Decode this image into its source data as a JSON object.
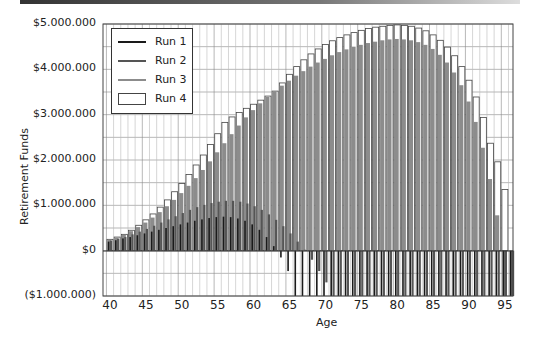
{
  "chart_data": {
    "type": "bar",
    "title": "",
    "xlabel": "Age",
    "ylabel": "Retirement Funds",
    "ylim": [
      -1000000,
      5000000
    ],
    "xlim": [
      40,
      96
    ],
    "grid": true,
    "legend_position": "upper-left",
    "y_ticks": [
      "$5.000.000",
      "$4.000.000",
      "$3.000.000",
      "$2.000.000",
      "$1.000.000",
      "$0",
      "($1.000.000)"
    ],
    "x_ticks": [
      "40",
      "45",
      "50",
      "55",
      "60",
      "65",
      "70",
      "75",
      "80",
      "85",
      "90",
      "95"
    ],
    "x": [
      40,
      41,
      42,
      43,
      44,
      45,
      46,
      47,
      48,
      49,
      50,
      51,
      52,
      53,
      54,
      55,
      56,
      57,
      58,
      59,
      60,
      61,
      62,
      63,
      64,
      65,
      66,
      67,
      68,
      69,
      70,
      71,
      72,
      73,
      74,
      75,
      76,
      77,
      78,
      79,
      80,
      81,
      82,
      83,
      84,
      85,
      86,
      87,
      88,
      89,
      90,
      91,
      92,
      93,
      94,
      95,
      96
    ],
    "series": [
      {
        "name": "Run 1",
        "color": "#1a1a1a",
        "values": [
          200000,
          230000,
          270000,
          300000,
          340000,
          380000,
          420000,
          460000,
          500000,
          540000,
          580000,
          620000,
          660000,
          690000,
          720000,
          740000,
          750000,
          740000,
          710000,
          660000,
          580000,
          460000,
          300000,
          100000,
          -150000,
          -450000,
          -1000000,
          -1000000,
          -1000000,
          -1000000,
          -1000000,
          -1000000,
          -1000000,
          -1000000,
          -1000000,
          -1000000,
          -1000000,
          -1000000,
          -1000000,
          -1000000,
          -1000000,
          -1000000,
          -1000000,
          -1000000,
          -1000000,
          -1000000,
          -1000000,
          -1000000,
          -1000000,
          -1000000,
          -1000000,
          -1000000,
          -1000000,
          -1000000,
          -1000000,
          -1000000,
          -1000000
        ]
      },
      {
        "name": "Run 2",
        "color": "#555555",
        "values": [
          220000,
          260000,
          300000,
          360000,
          420000,
          480000,
          550000,
          620000,
          690000,
          760000,
          830000,
          900000,
          960000,
          1010000,
          1050000,
          1080000,
          1100000,
          1100000,
          1080000,
          1040000,
          980000,
          900000,
          800000,
          680000,
          540000,
          380000,
          200000,
          20000,
          -200000,
          -450000,
          -700000,
          -1000000,
          -1000000,
          -1000000,
          -1000000,
          -1000000,
          -1000000,
          -1000000,
          -1000000,
          -1000000,
          -1000000,
          -1000000,
          -1000000,
          -1000000,
          -1000000,
          -1000000,
          -1000000,
          -1000000,
          -1000000,
          -1000000,
          -1000000,
          -1000000,
          -1000000,
          -1000000,
          -1000000,
          -1000000,
          -1000000
        ]
      },
      {
        "name": "Run 3",
        "color": "#8c8c8c",
        "values": [
          240000,
          290000,
          350000,
          430000,
          520000,
          620000,
          730000,
          850000,
          980000,
          1120000,
          1270000,
          1430000,
          1600000,
          1780000,
          1970000,
          2170000,
          2370000,
          2570000,
          2760000,
          2940000,
          3100000,
          3250000,
          3390000,
          3520000,
          3640000,
          3750000,
          3860000,
          3960000,
          4060000,
          4150000,
          4230000,
          4310000,
          4380000,
          4440000,
          4500000,
          4540000,
          4580000,
          4610000,
          4640000,
          4660000,
          4670000,
          4660000,
          4640000,
          4600000,
          4540000,
          4450000,
          4320000,
          4150000,
          3930000,
          3650000,
          3290000,
          2840000,
          2270000,
          1580000,
          780000,
          -1000000,
          -1000000
        ]
      },
      {
        "name": "Run 4",
        "color": "#ffffff",
        "values": [
          250000,
          300000,
          360000,
          450000,
          560000,
          680000,
          810000,
          960000,
          1120000,
          1300000,
          1480000,
          1680000,
          1890000,
          2110000,
          2340000,
          2580000,
          2830000,
          2950000,
          3050000,
          3140000,
          3230000,
          3320000,
          3410000,
          3520000,
          3700000,
          3890000,
          4060000,
          4210000,
          4340000,
          4450000,
          4550000,
          4630000,
          4700000,
          4760000,
          4810000,
          4860000,
          4900000,
          4930000,
          4950000,
          4970000,
          4980000,
          4970000,
          4950000,
          4910000,
          4850000,
          4760000,
          4640000,
          4490000,
          4300000,
          4060000,
          3760000,
          3390000,
          2940000,
          2370000,
          1960000,
          1350000,
          0
        ]
      }
    ]
  },
  "axes": {
    "ylabel": "Retirement Funds",
    "xlabel": "Age"
  },
  "legend": {
    "items": [
      {
        "label": "Run 1",
        "style": "line",
        "color": "#1a1a1a"
      },
      {
        "label": "Run 2",
        "style": "line",
        "color": "#555555"
      },
      {
        "label": "Run 3",
        "style": "line",
        "color": "#8c8c8c"
      },
      {
        "label": "Run 4",
        "style": "box",
        "color": "#ffffff"
      }
    ]
  }
}
